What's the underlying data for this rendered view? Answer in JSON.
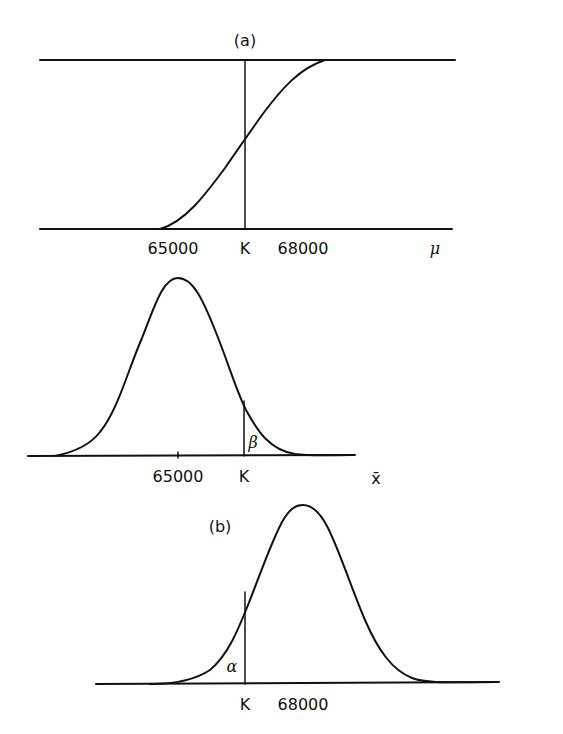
{
  "figure": {
    "panel_a": {
      "label": "(a)",
      "description": "Operating characteristic / power curve vs mu with critical value K",
      "x_ticks": [
        "65000",
        "K",
        "68000"
      ],
      "x_axis_label": "μ"
    },
    "panel_middle": {
      "description": "Sampling distribution of x-bar under mu = 65000 with beta tail right of K",
      "x_ticks": [
        "65000",
        "K"
      ],
      "x_axis_label": "x̄",
      "region_label": "β"
    },
    "panel_b": {
      "label": "(b)",
      "description": "Sampling distribution of x-bar under mu = 68000 with alpha tail left of K",
      "x_ticks": [
        "K",
        "68000"
      ],
      "region_label": "α"
    }
  },
  "colors": {
    "ink": "#111111",
    "background": "#ffffff"
  }
}
